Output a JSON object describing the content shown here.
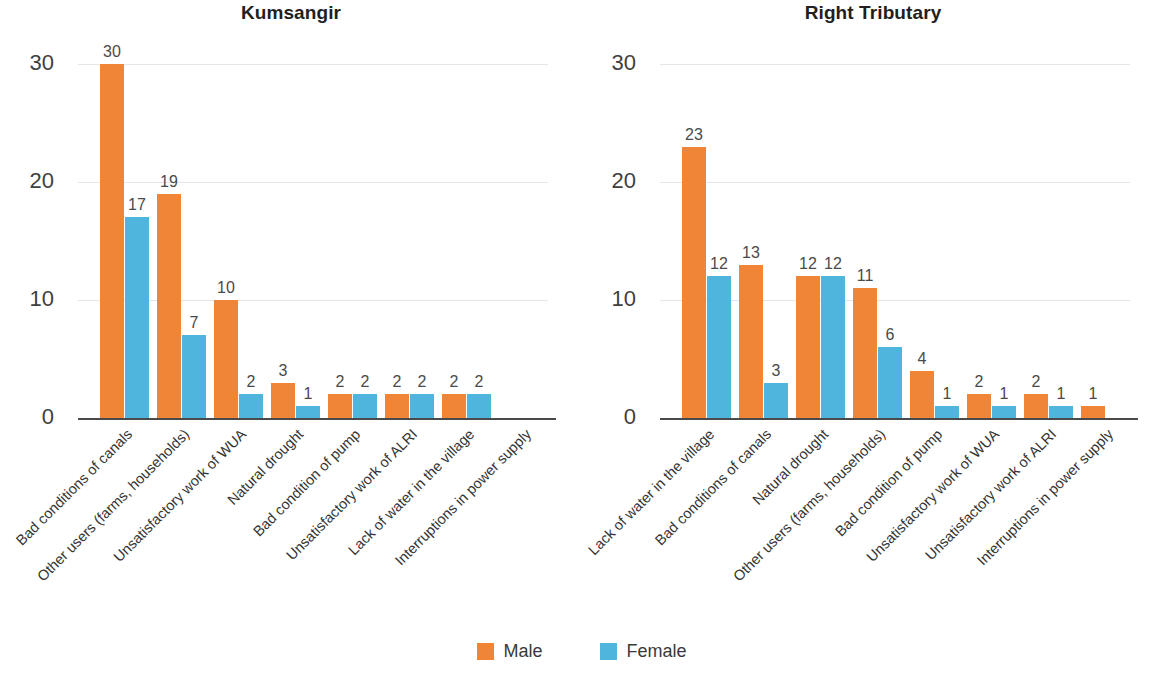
{
  "legend": {
    "items": [
      {
        "label": "Male",
        "color": "#f08437"
      },
      {
        "label": "Female",
        "color": "#4fb5dc"
      }
    ]
  },
  "axis": {
    "ticks": [
      "0",
      "10",
      "20",
      "30"
    ]
  },
  "chart_data": [
    {
      "type": "bar",
      "title": "Kumsangir",
      "xlabel": "",
      "ylabel": "",
      "ylim": [
        0,
        30
      ],
      "yticks": [
        0,
        10,
        20,
        30
      ],
      "grid": true,
      "legend_position": "bottom",
      "categories": [
        "Bad conditions of canals",
        "Other users (farms, households)",
        "Unsatisfactory work of WUA",
        "Natural drought",
        "Bad condition of pump",
        "Unsatisfactory work of ALRI",
        "Lack of water in the village",
        "Interruptions in power supply"
      ],
      "series": [
        {
          "name": "Male",
          "color": "#f08437",
          "values": [
            30,
            19,
            10,
            3,
            2,
            2,
            2,
            null
          ]
        },
        {
          "name": "Female",
          "color": "#4fb5dc",
          "values": [
            17,
            7,
            2,
            1,
            2,
            2,
            2,
            null
          ]
        }
      ]
    },
    {
      "type": "bar",
      "title": "Right Tributary",
      "xlabel": "",
      "ylabel": "",
      "ylim": [
        0,
        30
      ],
      "yticks": [
        0,
        10,
        20,
        30
      ],
      "grid": true,
      "legend_position": "bottom",
      "categories": [
        "Lack of water in the village",
        "Bad conditions of canals",
        "Natural drought",
        "Other users (farms, households)",
        "Bad condition of pump",
        "Unsatisfactory work of WUA",
        "Unsatisfactory work of ALRI",
        "Interruptions in power supply"
      ],
      "series": [
        {
          "name": "Male",
          "color": "#f08437",
          "values": [
            23,
            13,
            12,
            11,
            4,
            2,
            2,
            1
          ]
        },
        {
          "name": "Female",
          "color": "#4fb5dc",
          "values": [
            12,
            3,
            12,
            6,
            1,
            1,
            1,
            null
          ]
        }
      ]
    }
  ]
}
